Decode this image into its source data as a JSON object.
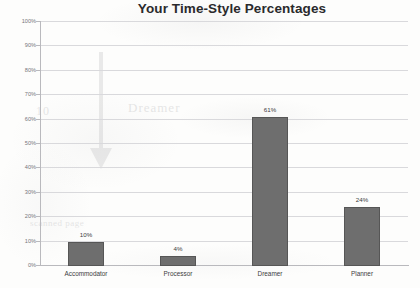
{
  "chart_data": {
    "type": "bar",
    "title": "Your Time-Style Percentages",
    "categories": [
      "Accommodator",
      "Processor",
      "Dreamer",
      "Planner"
    ],
    "values": [
      10,
      4,
      61,
      24
    ],
    "value_labels": [
      "10%",
      "4%",
      "61%",
      "24%"
    ],
    "xlabel": "",
    "ylabel": "",
    "ylim": [
      0,
      100
    ],
    "ytick_labels": [
      "100%",
      "90%",
      "80%",
      "70%",
      "60%",
      "50%",
      "40%",
      "30%",
      "20%",
      "10%",
      "0%"
    ],
    "ytick_values": [
      100,
      90,
      80,
      70,
      60,
      50,
      40,
      30,
      20,
      10,
      0
    ],
    "grid": true,
    "legend": false,
    "series": [
      {
        "name": "Time-Style Percentage",
        "values": [
          10,
          4,
          61,
          24
        ]
      }
    ],
    "colors": {
      "bar_fill": "#6e6e6e",
      "bar_stroke": "#565656",
      "gridline": "#d9d9dc",
      "axis_line": "#b9b9bd",
      "tick_text": "#76767b",
      "label_text": "#3c3c3e",
      "title_text": "#2a2a2c",
      "background": "#fdfdfc"
    }
  },
  "ghost": {
    "word_a": "Dreamer",
    "word_b": "10",
    "word_c": "scanned page"
  }
}
